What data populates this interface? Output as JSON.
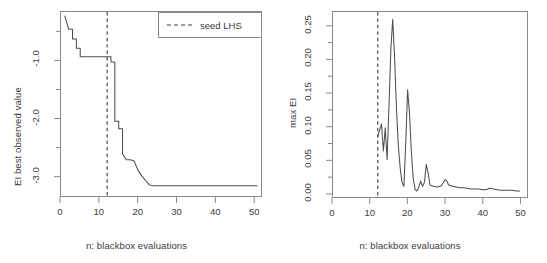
{
  "figure": {
    "panels": [
      {
        "id": "left",
        "ylabel": "EI best observed value",
        "xlabel": "n: blackbox evaluations",
        "yticks": [
          "-3.0",
          "-2.0",
          "-1.0"
        ],
        "ytick_values": [
          -3.0,
          -2.0,
          -1.0
        ],
        "xticks": [
          "0",
          "10",
          "20",
          "30",
          "40",
          "50"
        ],
        "xtick_values": [
          0,
          10,
          20,
          30,
          40,
          50
        ],
        "legend": {
          "label": "seed LHS",
          "style": "dashed"
        }
      },
      {
        "id": "right",
        "ylabel": "max EI",
        "xlabel": "n: blackbox evaluations",
        "yticks": [
          "0.00",
          "0.05",
          "0.10",
          "0.15",
          "0.20",
          "0.25"
        ],
        "ytick_values": [
          0.0,
          0.05,
          0.1,
          0.15,
          0.2,
          0.25
        ],
        "xticks": [
          "0",
          "10",
          "20",
          "30",
          "40",
          "50"
        ],
        "xtick_values": [
          0,
          10,
          20,
          30,
          40,
          50
        ]
      }
    ]
  },
  "chart_data": [
    {
      "type": "line",
      "id": "left-panel-best-observed",
      "title": "",
      "xlabel": "n: blackbox evaluations",
      "ylabel": "EI best observed value",
      "xlim": [
        0,
        52
      ],
      "ylim": [
        -3.35,
        -0.15
      ],
      "grid": false,
      "legend_position": "top-right",
      "series": [
        {
          "name": "EI best observed value",
          "style": "solid",
          "color": "#4d4d4d",
          "x": [
            1,
            2,
            3,
            3,
            4,
            4,
            5,
            5,
            12,
            13,
            13,
            14,
            14,
            15,
            15,
            16,
            16,
            17,
            18,
            19,
            20,
            21,
            22,
            23,
            24,
            30,
            40,
            51
          ],
          "y": [
            -0.22,
            -0.45,
            -0.45,
            -0.62,
            -0.62,
            -0.78,
            -0.78,
            -0.93,
            -0.93,
            -0.93,
            -1.02,
            -1.02,
            -2.05,
            -2.05,
            -2.18,
            -2.18,
            -2.62,
            -2.72,
            -2.72,
            -2.74,
            -2.9,
            -3.0,
            -3.08,
            -3.16,
            -3.17,
            -3.17,
            -3.17,
            -3.17
          ],
          "note": "monotone decreasing staircase of best-so-far objective value"
        },
        {
          "name": "seed LHS",
          "style": "dashed",
          "color": "#3a3a3a",
          "vline_x": 12
        }
      ]
    },
    {
      "type": "line",
      "id": "right-panel-max-ei",
      "title": "",
      "xlabel": "n: blackbox evaluations",
      "ylabel": "max EI",
      "xlim": [
        0,
        52
      ],
      "ylim": [
        -0.006,
        0.272
      ],
      "grid": false,
      "legend_position": "none",
      "series": [
        {
          "name": "max EI",
          "style": "solid",
          "color": "#4d4d4d",
          "x": [
            12,
            13,
            13.5,
            14,
            14.5,
            15,
            15.5,
            16,
            16.5,
            17,
            17.5,
            18,
            18.5,
            19,
            19.5,
            20,
            20.5,
            21,
            21.5,
            22,
            22.5,
            23,
            23.5,
            24,
            24.5,
            25,
            25.5,
            26,
            26.5,
            27,
            28,
            29,
            29.5,
            30,
            30.5,
            31,
            32,
            33,
            34,
            35,
            36,
            37,
            38,
            39,
            40,
            41,
            42,
            43,
            44,
            45,
            46,
            47,
            48,
            49,
            50
          ],
          "y": [
            0.085,
            0.104,
            0.063,
            0.098,
            0.05,
            0.13,
            0.215,
            0.261,
            0.205,
            0.128,
            0.072,
            0.038,
            0.016,
            0.01,
            0.075,
            0.155,
            0.12,
            0.062,
            0.022,
            0.005,
            0.003,
            0.009,
            0.018,
            0.01,
            0.016,
            0.043,
            0.03,
            0.012,
            0.011,
            0.01,
            0.009,
            0.011,
            0.015,
            0.02,
            0.018,
            0.012,
            0.01,
            0.009,
            0.008,
            0.008,
            0.007,
            0.006,
            0.006,
            0.006,
            0.005,
            0.005,
            0.007,
            0.006,
            0.005,
            0.004,
            0.004,
            0.004,
            0.004,
            0.003,
            0.003
          ],
          "note": "spiky expected-improvement acquisition values, largest peak 0.26 near n=16"
        },
        {
          "name": "seed LHS",
          "style": "dashed",
          "color": "#3a3a3a",
          "vline_x": 12
        }
      ]
    }
  ]
}
